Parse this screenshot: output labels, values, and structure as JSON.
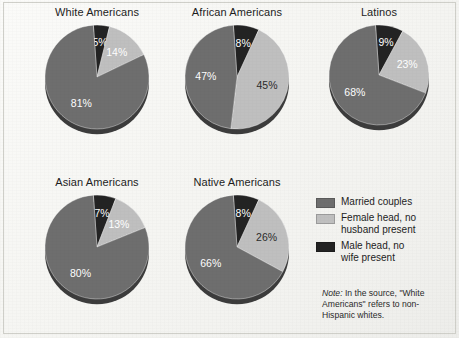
{
  "figure": {
    "background_color": "#f4f4f1",
    "border_color": "#cfcfc9"
  },
  "colors": {
    "married": "#6e6e6e",
    "female_head": "#bfbfbf",
    "male_head": "#232323",
    "pie_edge_shadow": "#3c3c3c",
    "text": "#1d1d1d"
  },
  "legend": {
    "items": [
      {
        "label": "Married couples",
        "color": "#6e6e6e",
        "swatch_name": "legend-swatch-married"
      },
      {
        "label": "Female head, no\nhusband present",
        "color": "#bfbfbf",
        "swatch_name": "legend-swatch-female-head"
      },
      {
        "label": "Male head, no\nwife present",
        "color": "#232323",
        "swatch_name": "legend-swatch-male-head"
      }
    ]
  },
  "note": {
    "prefix": "Note:",
    "text": " In the source, \"White Americans\" refers to non-Hispanic whites."
  },
  "chart_data": [
    {
      "type": "pie",
      "title": "White Americans",
      "categories": [
        "Married couples",
        "Female head, no husband present",
        "Male head, no wife present"
      ],
      "values": [
        81,
        14,
        5
      ],
      "labels": [
        "81%",
        "14%",
        "5%"
      ],
      "colors": [
        "#6e6e6e",
        "#bfbfbf",
        "#232323"
      ],
      "label_styles": [
        "light",
        "light",
        "light"
      ]
    },
    {
      "type": "pie",
      "title": "African Americans",
      "categories": [
        "Married couples",
        "Female head, no husband present",
        "Male head, no wife present"
      ],
      "values": [
        47,
        45,
        8
      ],
      "labels": [
        "47%",
        "45%",
        "8%"
      ],
      "colors": [
        "#6e6e6e",
        "#bfbfbf",
        "#232323"
      ],
      "label_styles": [
        "light",
        "dark",
        "light"
      ]
    },
    {
      "type": "pie",
      "title": "Latinos",
      "categories": [
        "Married couples",
        "Female head, no husband present",
        "Male head, no wife present"
      ],
      "values": [
        68,
        23,
        9
      ],
      "labels": [
        "68%",
        "23%",
        "9%"
      ],
      "colors": [
        "#6e6e6e",
        "#bfbfbf",
        "#232323"
      ],
      "label_styles": [
        "light",
        "light",
        "light"
      ]
    },
    {
      "type": "pie",
      "title": "Asian Americans",
      "categories": [
        "Married couples",
        "Female head, no husband present",
        "Male head, no wife present"
      ],
      "values": [
        80,
        13,
        7
      ],
      "labels": [
        "80%",
        "13%",
        "7%"
      ],
      "colors": [
        "#6e6e6e",
        "#bfbfbf",
        "#232323"
      ],
      "label_styles": [
        "light",
        "light",
        "light"
      ]
    },
    {
      "type": "pie",
      "title": "Native Americans",
      "categories": [
        "Married couples",
        "Female head, no husband present",
        "Male head, no wife present"
      ],
      "values": [
        66,
        26,
        8
      ],
      "labels": [
        "66%",
        "26%",
        "8%"
      ],
      "colors": [
        "#6e6e6e",
        "#bfbfbf",
        "#232323"
      ],
      "label_styles": [
        "light",
        "dark",
        "light"
      ]
    }
  ],
  "layout": {
    "charts": [
      {
        "left": 28,
        "top": 6,
        "width": 138,
        "radius": 52,
        "label_radius_factor": 0.6
      },
      {
        "left": 168,
        "top": 6,
        "width": 138,
        "radius": 52,
        "label_radius_factor": 0.6
      },
      {
        "left": 310,
        "top": 6,
        "width": 138,
        "radius": 50,
        "label_radius_factor": 0.6
      },
      {
        "left": 28,
        "top": 176,
        "width": 138,
        "radius": 52,
        "label_radius_factor": 0.6
      },
      {
        "left": 168,
        "top": 176,
        "width": 138,
        "radius": 52,
        "label_radius_factor": 0.6
      }
    ]
  }
}
